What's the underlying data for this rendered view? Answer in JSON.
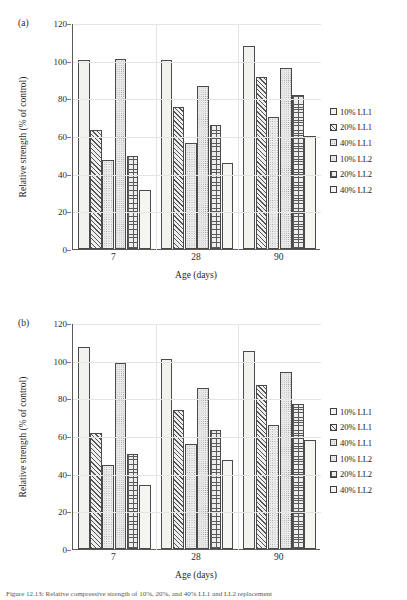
{
  "figure": {
    "caption": "Figure 12.13: Relative compressive strength of 10%, 20%, and 40% LL1 and LL2 replacement"
  },
  "legend": {
    "position": "right",
    "items": [
      {
        "label": "10% LL1",
        "pattern": "plain"
      },
      {
        "label": "20% LL1",
        "pattern": "diagonal-hatch"
      },
      {
        "label": "40% LL1",
        "pattern": "light-dots"
      },
      {
        "label": "10% LL2",
        "pattern": "medium-dots"
      },
      {
        "label": "20% LL2",
        "pattern": "cross-hatch"
      },
      {
        "label": "40% LL2",
        "pattern": "white"
      }
    ]
  },
  "panels": [
    {
      "tag": "(a)"
    },
    {
      "tag": "(b)"
    }
  ],
  "chart_data": [
    {
      "type": "bar",
      "title": "(a)",
      "xlabel": "Age (days)",
      "ylabel": "Relative strength (% of control)",
      "categories": [
        "7",
        "28",
        "90"
      ],
      "ylim": [
        0,
        120
      ],
      "yticks": [
        0,
        20,
        40,
        60,
        80,
        100,
        120
      ],
      "grid": true,
      "series": [
        {
          "name": "10% LL1",
          "values": [
            100.5,
            100.5,
            108.0
          ]
        },
        {
          "name": "20% LL1",
          "values": [
            63.0,
            75.5,
            91.5
          ]
        },
        {
          "name": "40% LL1",
          "values": [
            47.5,
            56.5,
            70.0
          ]
        },
        {
          "name": "10% LL2",
          "values": [
            101.0,
            86.5,
            96.0
          ]
        },
        {
          "name": "20% LL2",
          "values": [
            49.5,
            66.0,
            82.0
          ]
        },
        {
          "name": "40% LL2",
          "values": [
            31.5,
            45.5,
            60.0
          ]
        }
      ]
    },
    {
      "type": "bar",
      "title": "(b)",
      "xlabel": "Age (days)",
      "ylabel": "Relative strength (% of control)",
      "categories": [
        "7",
        "28",
        "90"
      ],
      "ylim": [
        0,
        120
      ],
      "yticks": [
        0,
        20,
        40,
        60,
        80,
        100,
        120
      ],
      "grid": true,
      "series": [
        {
          "name": "10% LL1",
          "values": [
            107.5,
            101.0,
            105.0
          ]
        },
        {
          "name": "20% LL1",
          "values": [
            61.5,
            74.0,
            87.0
          ]
        },
        {
          "name": "40% LL1",
          "values": [
            44.5,
            55.5,
            66.0
          ]
        },
        {
          "name": "10% LL2",
          "values": [
            99.0,
            85.5,
            94.0
          ]
        },
        {
          "name": "20% LL2",
          "values": [
            50.5,
            63.0,
            77.0
          ]
        },
        {
          "name": "40% LL2",
          "values": [
            34.0,
            47.0,
            58.0
          ]
        }
      ]
    }
  ]
}
